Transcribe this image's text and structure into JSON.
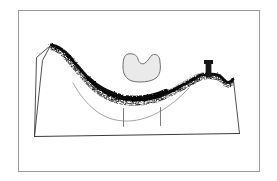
{
  "figure": {
    "caption": "",
    "background_color": "#ffffff",
    "frame": {
      "name": "image-border",
      "x": 18,
      "y": 10,
      "width": 241,
      "height": 161,
      "stroke_color": "#9a9a9a",
      "stroke_width": 1,
      "fill": "none"
    },
    "strokes": {
      "line_color": "#3c3c3c",
      "thin_line_color": "#8d8d8d",
      "ridge_color": "#161616",
      "blob_fill": "#eaeaea",
      "blob_stroke": "#6e6e6e"
    },
    "elements": [
      {
        "name": "terrain-outline-left-face",
        "type": "polyline",
        "label": "left escarpment face",
        "color": "#3c3c3c",
        "width": 0.9,
        "points": "50.5,45.5 36.5,57.5 34.5,136.5"
      },
      {
        "name": "terrain-outline-left-inner-edge",
        "type": "polyline",
        "label": "left inner ridge edge",
        "color": "#3c3c3c",
        "width": 0.9,
        "points": "50.5,45.5 42.5,60.5 34.5,136.5"
      },
      {
        "name": "terrain-outline-base",
        "type": "polyline",
        "label": "ground baseline",
        "color": "#3c3c3c",
        "width": 1.0,
        "points": "34.5,136.5 239.5,133.5"
      },
      {
        "name": "terrain-outline-right-face",
        "type": "polyline",
        "label": "right escarpment face",
        "color": "#3c3c3c",
        "width": 0.9,
        "points": "233.5,80.5 239.5,133.5"
      },
      {
        "name": "valley-guide-arc",
        "type": "path",
        "label": "thin interior guide arc across valley",
        "color": "#8d8d8d",
        "width": 0.8,
        "d": "M 73,83 C 86,106 102,120 124,121 C 148,122 170,108 189,88"
      },
      {
        "name": "measure-tick-left",
        "type": "line",
        "label": "left measurement tick",
        "color": "#7d7d7d",
        "width": 1.0,
        "x1": 123.5,
        "y1": 108.5,
        "x2": 123.5,
        "y2": 126.5
      },
      {
        "name": "measure-tick-right",
        "type": "line",
        "label": "right measurement tick",
        "color": "#7d7d7d",
        "width": 1.0,
        "x1": 160.5,
        "y1": 107.5,
        "x2": 160.5,
        "y2": 125.5
      },
      {
        "name": "ridge-profile-band",
        "type": "path",
        "label": "stippled dark ridge / valley profile",
        "color": "#161616",
        "d": "M 51,45 C 58,46 64,50 70,57 C 77,65 83,73 91,81 C 99,90 110,96 124,99 C 140,101 154,99 167,93 C 180,87 191,80 201,75 L 208,74 C 214,74 218,75 220,76 L 225,81 C 228,84 231,82 233,79"
      },
      {
        "name": "spike-tower",
        "type": "rect",
        "label": "vertical tower / chimney spike on right ridge",
        "color": "#161616",
        "x": 205.5,
        "y": 61.5,
        "width": 6,
        "height": 16
      },
      {
        "name": "spike-tower-cap",
        "type": "rect",
        "label": "tower cap",
        "color": "#161616",
        "x": 204.0,
        "y": 60.0,
        "width": 9,
        "height": 4
      },
      {
        "name": "cloud-blob",
        "type": "path",
        "label": "bean shaped blob above valley",
        "fill": "#eaeaea",
        "stroke": "#6e6e6e",
        "stroke_width": 1.0,
        "d": "M 128,54 C 133,53 137,55 138,59 C 139,63 142,65 145,63 C 148,61 150,57 152,55 C 156,53 160,56 160,62 C 161,69 160,75 156,78 C 151,82 139,83 132,81 C 126,79 123,74 123,67 C 123,60 124,55 128,54 Z"
      }
    ],
    "texture": {
      "name": "ridge-stipple",
      "description": "dense irregular stipple dots along the ridge band giving a rough charcoal texture",
      "dot_color": "#0d0d0d",
      "density": "high"
    }
  }
}
